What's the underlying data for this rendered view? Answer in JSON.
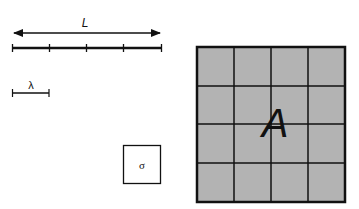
{
  "labels": {
    "length": "L",
    "wavelength": "λ",
    "sigma": "σ",
    "area": "A"
  },
  "colors": {
    "stroke": "#111111",
    "grid_fill": "#b3b3b3",
    "background": "#ffffff"
  },
  "ruler": {
    "segments": 4
  },
  "grid": {
    "rows": 4,
    "cols": 4
  }
}
